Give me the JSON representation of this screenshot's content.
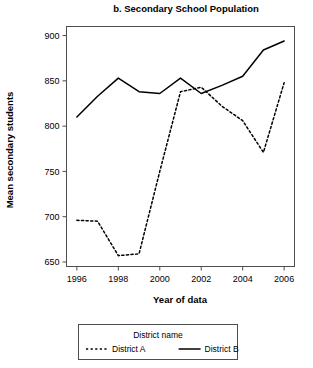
{
  "chart_data": {
    "type": "line",
    "title": "b. Secondary School Population",
    "xlabel": "Year of data",
    "ylabel": "Mean secondary students",
    "x": [
      1996,
      1997,
      1998,
      1999,
      2000,
      2001,
      2002,
      2003,
      2004,
      2005,
      2006
    ],
    "xlim": [
      1995.5,
      2006.5
    ],
    "ylim": [
      645,
      910
    ],
    "xticks": [
      1996,
      1998,
      2000,
      2002,
      2004,
      2006
    ],
    "xtick_labels": [
      "1996",
      "1998",
      "2000",
      "2002",
      "2004",
      "2006"
    ],
    "yticks": [
      650,
      700,
      750,
      800,
      850,
      900
    ],
    "ytick_labels": [
      "650",
      "700",
      "750",
      "800",
      "850",
      "900"
    ],
    "grid": false,
    "legend_position": "bottom",
    "legend_title": "District name",
    "series": [
      {
        "name": "District  A",
        "style": "dashed",
        "color": "#000000",
        "values": [
          696,
          695,
          657,
          659,
          750,
          838,
          843,
          822,
          806,
          771,
          848
        ]
      },
      {
        "name": "District  B",
        "style": "solid",
        "color": "#000000",
        "values": [
          810,
          833,
          853,
          838,
          836,
          853,
          836,
          845,
          855,
          884,
          894
        ]
      }
    ]
  },
  "legend": {
    "title": "District name",
    "entries": [
      {
        "label": "District  A",
        "style": "dashed"
      },
      {
        "label": "District  B",
        "style": "solid"
      }
    ]
  }
}
